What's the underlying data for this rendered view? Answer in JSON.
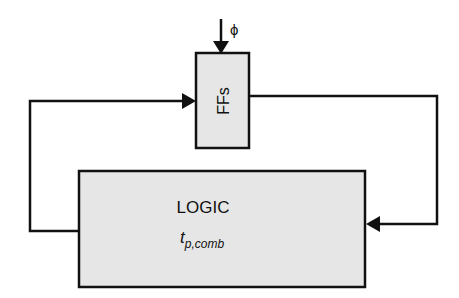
{
  "diagram": {
    "ffs_block": {
      "label": "FFs"
    },
    "logic_block": {
      "label": "LOGIC",
      "delay_symbol": "t",
      "delay_subscript": "p,comb"
    },
    "clock_input": {
      "label": "ϕ"
    },
    "colors": {
      "block_fill": "#e6e6e6",
      "stroke": "#111111",
      "background": "#ffffff"
    }
  }
}
